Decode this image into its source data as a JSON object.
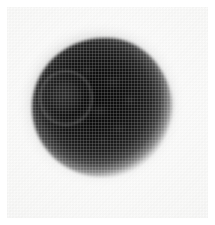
{
  "figure": {
    "kind": "halftone-photographic-plate",
    "caption": "",
    "canvas": {
      "width_px": 215,
      "height_px": 225
    },
    "background": {
      "margin_color": "#ffffff",
      "plate_color": "#f7f7f6",
      "margin_px": 7,
      "texture": "diagonal halftone dot screen"
    },
    "subject": {
      "name": "dark rounded specimen",
      "description": "Dense near-black rounded mass with a tapering protrusion toward the right side and a faint circular internal ring on the left.",
      "core_color": "#030303",
      "midtone_color": "#1d1d1d",
      "edge_color": "#c8c8c8",
      "bounds_px": {
        "x": 32,
        "y": 38,
        "width": 143,
        "height": 137
      },
      "center_px": {
        "x": 100,
        "y": 107
      }
    },
    "features": [
      {
        "name": "main-mass",
        "label": "Main rounded body",
        "center_px": {
          "x": 101,
          "y": 107
        },
        "radius_px": 70,
        "tone": "near-black"
      },
      {
        "name": "right-protrusion",
        "label": "Tapering right-hand protrusion",
        "tip_px": {
          "x": 173,
          "y": 106
        },
        "tone": "dark grey, softly blurred"
      },
      {
        "name": "inner-ring",
        "label": "Faint internal circular ring",
        "center_px": {
          "x": 64,
          "y": 96
        },
        "radius_px": 26,
        "tone": "light grey outline on dark field"
      },
      {
        "name": "granular-interior",
        "label": "Mottled granular interior texture",
        "tone": "irregular light speckling"
      }
    ],
    "palette": {
      "white": "#ffffff",
      "paper": "#f7f7f6",
      "paper_shadow": "#eeeeec",
      "specimen_core": "#030303",
      "specimen_mid": "#1d1d1d",
      "specimen_rim": "#7e7e7e",
      "ring_outline": "#969696"
    }
  }
}
